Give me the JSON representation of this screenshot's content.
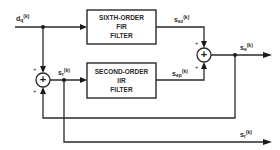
{
  "diagram": {
    "type": "signal-flow block diagram",
    "blocks": {
      "fir": {
        "line1": "SIXTH-ORDER",
        "line2": "FIR",
        "line3": "FILTER"
      },
      "iir": {
        "line1": "SECOND-ORDER",
        "line2": "IIR",
        "line3": "FILTER"
      }
    },
    "signals": {
      "input": {
        "base": "d",
        "sub": "q",
        "arg": "(k)"
      },
      "fir_out": {
        "base": "s",
        "sub": "ez",
        "arg": "(k)"
      },
      "iir_out": {
        "base": "s",
        "sub": "ep",
        "arg": "(k)"
      },
      "estimate": {
        "base": "s",
        "sub": "e",
        "arg": "(k)"
      },
      "reconstructed": {
        "base": "s",
        "sub": "r",
        "arg": "(k)"
      },
      "reconstructed_out": {
        "base": "s",
        "sub": "r",
        "arg": "(k)"
      }
    },
    "adders": {
      "left": {
        "symbol": "+",
        "in_top_sign": "+",
        "in_bottom_sign": "+"
      },
      "right": {
        "symbol": "+",
        "in_top_sign": "+",
        "in_bottom_sign": "+"
      }
    },
    "colors": {
      "ink": "#2a2a2a",
      "background": "#ffffff"
    }
  }
}
